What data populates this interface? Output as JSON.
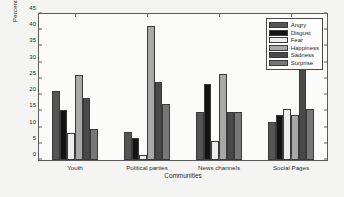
{
  "chart_data": {
    "type": "bar",
    "title": "",
    "xlabel": "Communities",
    "ylabel": "Percentage of Users",
    "categories": [
      "Youth",
      "Political parties",
      "News channels",
      "Social Pages"
    ],
    "ylim": [
      0,
      45
    ],
    "yticks": [
      0,
      5,
      10,
      15,
      20,
      25,
      30,
      35,
      40,
      45
    ],
    "grid": false,
    "legend_position": "top-right",
    "series": [
      {
        "name": "Angry",
        "color": "#555555",
        "values": [
          21.4,
          8.6,
          14.7,
          11.7
        ]
      },
      {
        "name": "Disgust",
        "color": "#141414",
        "values": [
          15.5,
          6.9,
          23.5,
          13.8
        ]
      },
      {
        "name": "Fear",
        "color": "#ededed",
        "values": [
          8.3,
          1.7,
          5.9,
          15.6
        ]
      },
      {
        "name": "Happiness",
        "color": "#a8a8a8",
        "values": [
          26.3,
          41.4,
          26.4,
          13.9
        ]
      },
      {
        "name": "Sadness",
        "color": "#4a4a4a",
        "values": [
          19.0,
          24.2,
          14.7,
          29.5
        ]
      },
      {
        "name": "Surprise",
        "color": "#767676",
        "values": [
          9.5,
          17.2,
          14.7,
          15.7
        ]
      }
    ]
  }
}
